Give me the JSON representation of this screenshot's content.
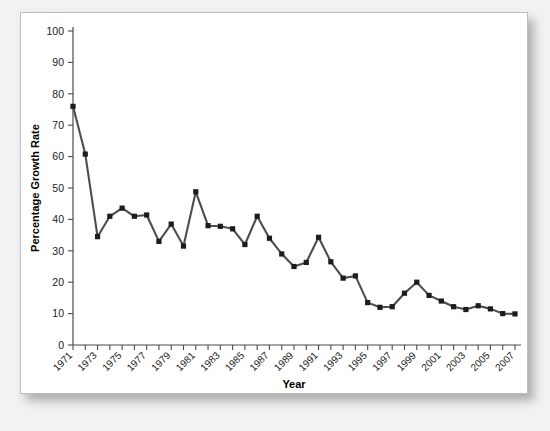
{
  "chart_data": {
    "type": "line",
    "title": "",
    "xlabel": "Year",
    "ylabel": "Percentage Growth Rate",
    "xlim": [
      1971,
      2007
    ],
    "ylim": [
      0,
      100
    ],
    "ytick_step": 10,
    "yticks": [
      0,
      10,
      20,
      30,
      40,
      50,
      60,
      70,
      80,
      90,
      100
    ],
    "ytick_labels": [
      "0",
      "10",
      "20",
      "30",
      "40",
      "50",
      "60",
      "70",
      "80",
      "90",
      "100"
    ],
    "xticks": [
      1971,
      1972,
      1973,
      1974,
      1975,
      1976,
      1977,
      1978,
      1979,
      1980,
      1981,
      1982,
      1983,
      1984,
      1985,
      1986,
      1987,
      1988,
      1989,
      1990,
      1991,
      1992,
      1993,
      1994,
      1995,
      1996,
      1997,
      1998,
      1999,
      2000,
      2001,
      2002,
      2003,
      2004,
      2005,
      2006,
      2007
    ],
    "xtick_labels": [
      "1971",
      "",
      "1973",
      "",
      "1975",
      "",
      "1977",
      "",
      "1979",
      "",
      "1981",
      "",
      "1983",
      "",
      "1985",
      "",
      "1987",
      "",
      "1989",
      "",
      "1991",
      "",
      "1993",
      "",
      "1995",
      "",
      "1997",
      "",
      "1999",
      "",
      "2001",
      "",
      "2003",
      "",
      "2005",
      "",
      "2007"
    ],
    "grid": false,
    "legend": false,
    "marker": "square",
    "line_color": "#4d4d4d",
    "marker_color": "#1c1c1c",
    "x": [
      1971,
      1972,
      1973,
      1974,
      1975,
      1976,
      1977,
      1978,
      1979,
      1980,
      1981,
      1982,
      1983,
      1984,
      1985,
      1986,
      1987,
      1988,
      1989,
      1990,
      1991,
      1992,
      1993,
      1994,
      1995,
      1996,
      1997,
      1998,
      1999,
      2000,
      2001,
      2002,
      2003,
      2004,
      2005,
      2006,
      2007
    ],
    "values": [
      76.0,
      60.8,
      34.5,
      41.0,
      43.6,
      41.0,
      41.4,
      33.0,
      38.5,
      31.5,
      48.8,
      38.0,
      37.8,
      37.0,
      32.0,
      41.0,
      34.0,
      29.0,
      25.0,
      26.3,
      34.3,
      26.5,
      21.3,
      22.0,
      13.5,
      12.0,
      12.2,
      16.5,
      20.0,
      15.8,
      14.0,
      12.2,
      11.3,
      12.5,
      11.5,
      10.0,
      9.9
    ]
  }
}
